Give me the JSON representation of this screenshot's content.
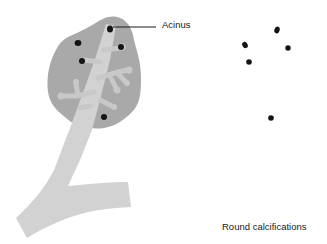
{
  "figure": {
    "labels": {
      "acinus": "Acinus",
      "round_calcifications": "Round calcifications"
    },
    "colors": {
      "lobule": "#a9a9a9",
      "duct": "#d2d2d2",
      "calcification": "#141414",
      "leader_line": "#1a1a1a",
      "background": "#ffffff"
    },
    "lobule_calcifications": [
      {
        "x": 110,
        "y": 29
      },
      {
        "x": 78,
        "y": 43
      },
      {
        "x": 121,
        "y": 47
      },
      {
        "x": 82,
        "y": 61
      },
      {
        "x": 104,
        "y": 117
      }
    ],
    "isolated_calcifications": [
      {
        "x": 277,
        "y": 30
      },
      {
        "x": 245,
        "y": 45
      },
      {
        "x": 288,
        "y": 48
      },
      {
        "x": 249,
        "y": 62
      },
      {
        "x": 271,
        "y": 118
      }
    ]
  }
}
